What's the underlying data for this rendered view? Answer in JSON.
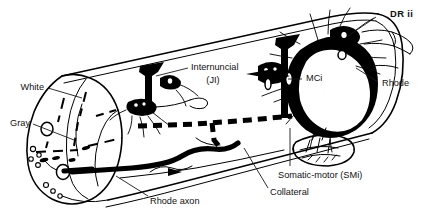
{
  "figure": {
    "background_color": "#ffffff",
    "ink_color": "#000000",
    "width": 441,
    "height": 221
  },
  "labels": {
    "dr_ii": "DR ii",
    "rhode_right": "Rhode",
    "internuncial": "Internuncial",
    "internuncial_abbrev": "(JI)",
    "mci": "MCi",
    "white": "White",
    "gray": "Gray",
    "rhode_axon": "Rhode axon",
    "collateral": "Collateral",
    "somatic_motor": "Somatic-motor (SMi)"
  },
  "structures": {
    "cord_cylinder": "spinal-cord-cylinder",
    "cross_section": "left-cross-section",
    "white_matter": "white-matter-region",
    "gray_matter": "gray-matter-butterfly",
    "internuncial_neuron": "internuncial-neuron-cluster",
    "motor_neuron_cluster": "motor-neuron-cluster",
    "dorsal_root": "dorsal-root-nerve",
    "muscle": "muscle-endplate",
    "rohde_axon_path": "rohde-giant-axon",
    "collateral_branch": "collateral-branch-dashed"
  }
}
